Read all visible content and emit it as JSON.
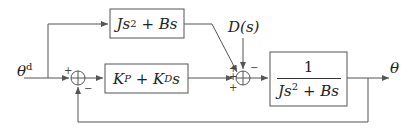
{
  "diagram": {
    "type": "control-block-diagram",
    "input_label": "θ",
    "input_label_superscript": "d",
    "output_label": "θ",
    "disturbance_label": "D(s)",
    "blocks": [
      {
        "id": "feedforward",
        "expr_main": "Js",
        "expr_sup": "2",
        "expr_tail": " + Bs"
      },
      {
        "id": "controller",
        "kp": "K",
        "kp_sub": "P",
        "plus": " + ",
        "kd": "K",
        "kd_sub": "D",
        "kd_tail": "s"
      },
      {
        "id": "plant",
        "numerator": "1",
        "den_main": "Js",
        "den_sup": "2",
        "den_tail": " + Bs"
      }
    ],
    "summing_junctions": [
      {
        "id": "sum1",
        "signs": {
          "left": "+",
          "bottom": "−"
        }
      },
      {
        "id": "sum2",
        "signs": {
          "top_left": "+",
          "left": "+",
          "bottom_left": "+",
          "top_right": "−"
        }
      }
    ],
    "colors": {
      "line": "#555555",
      "text": "#222222",
      "background": "#ffffff"
    }
  }
}
